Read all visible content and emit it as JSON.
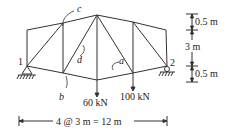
{
  "diagram": {
    "type": "truss",
    "nodes": {
      "support_left": "1",
      "support_right": "2"
    },
    "member_labels": [
      "a",
      "b",
      "c",
      "d"
    ],
    "loads": [
      {
        "label": "60 kN",
        "node": "bottom-center"
      },
      {
        "label": "100 kN",
        "node": "bottom-right-interior"
      }
    ],
    "dimensions": {
      "span": "4 @ 3 m = 12 m",
      "height_top": "0.5 m",
      "height_mid": "3 m",
      "height_bottom": "0.5 m"
    },
    "colors": {
      "line": "#333333",
      "text": "#222222",
      "background": "#ffffff"
    }
  }
}
